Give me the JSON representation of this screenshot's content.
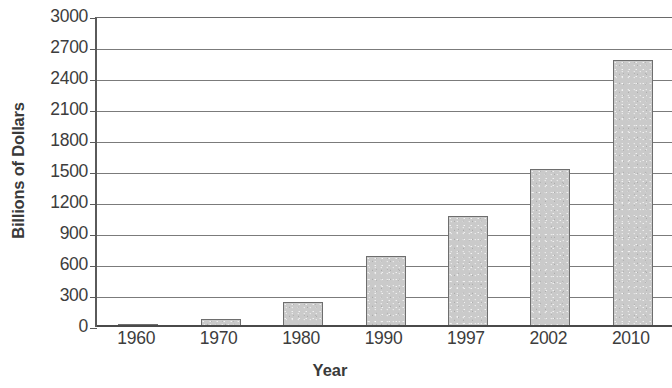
{
  "chart_data": {
    "type": "bar",
    "title": "",
    "xlabel": "Year",
    "ylabel": "Billions of Dollars",
    "categories": [
      "1960",
      "1970",
      "1980",
      "1990",
      "1997",
      "2002",
      "2010"
    ],
    "values": [
      30,
      80,
      240,
      690,
      1070,
      1530,
      2580
    ],
    "ylim": [
      0,
      3000
    ],
    "ytick_labels": [
      "3000",
      "2700",
      "2400",
      "2100",
      "1800",
      "1500",
      "1200",
      "900",
      "600",
      "300",
      "0"
    ],
    "ytick_values": [
      3000,
      2700,
      2400,
      2100,
      1800,
      1500,
      1200,
      900,
      600,
      300,
      0
    ],
    "ytick_step": 300,
    "grid": true,
    "legend": "none",
    "series": [
      {
        "name": "Billions of Dollars",
        "values": [
          30,
          80,
          240,
          690,
          1070,
          1530,
          2580
        ]
      }
    ],
    "colors": {
      "bar_fill": "#cacaca",
      "bar_border": "#6e6e6e",
      "gridline": "#7b7b7b",
      "axis": "#4a4a4a",
      "text": "#3d3d3d"
    }
  }
}
